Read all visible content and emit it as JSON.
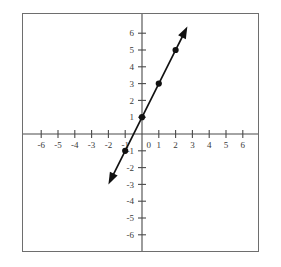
{
  "chart_data": {
    "type": "line",
    "title": "",
    "subtitle": "",
    "xlabel": "",
    "ylabel": "",
    "xlim": [
      -7,
      7
    ],
    "ylim": [
      -7,
      7
    ],
    "grid": false,
    "legend": null,
    "annotations": [],
    "x_tick_labels": [
      "-6",
      "-5",
      "-4",
      "-3",
      "-2",
      "-1",
      "0",
      "1",
      "2",
      "3",
      "4",
      "5",
      "6"
    ],
    "x_tick_values": [
      -6,
      -5,
      -4,
      -3,
      -2,
      -1,
      0,
      1,
      2,
      3,
      4,
      5,
      6
    ],
    "y_tick_labels": [
      "6",
      "5",
      "4",
      "3",
      "2",
      "1",
      "-1",
      "-2",
      "-3",
      "-4",
      "-5",
      "-6"
    ],
    "y_tick_values": [
      6,
      5,
      4,
      3,
      2,
      1,
      -1,
      -2,
      -3,
      -4,
      -5,
      -6
    ],
    "origin_label": "0",
    "series": [
      {
        "name": "y = 2x + 1",
        "equation": "y = 2x + 1",
        "slope": 2,
        "intercept": 1,
        "color": "#111111",
        "line_start": [
          -1.85,
          -2.7
        ],
        "line_end": [
          2.55,
          6.1
        ],
        "arrow_start": [
          -2.0,
          -3.0
        ],
        "arrow_end": [
          2.7,
          6.4
        ],
        "double_arrow": true,
        "points": [
          {
            "x": -1,
            "y": -1
          },
          {
            "x": 0,
            "y": 1
          },
          {
            "x": 1,
            "y": 3
          },
          {
            "x": 2,
            "y": 5
          }
        ]
      }
    ]
  },
  "frame": {
    "border_color": "#6e6e6e",
    "background": "#ffffff"
  },
  "axis": {
    "color": "#4a4a4a",
    "x_axis_name": "x-axis",
    "y_axis_name": "y-axis"
  }
}
